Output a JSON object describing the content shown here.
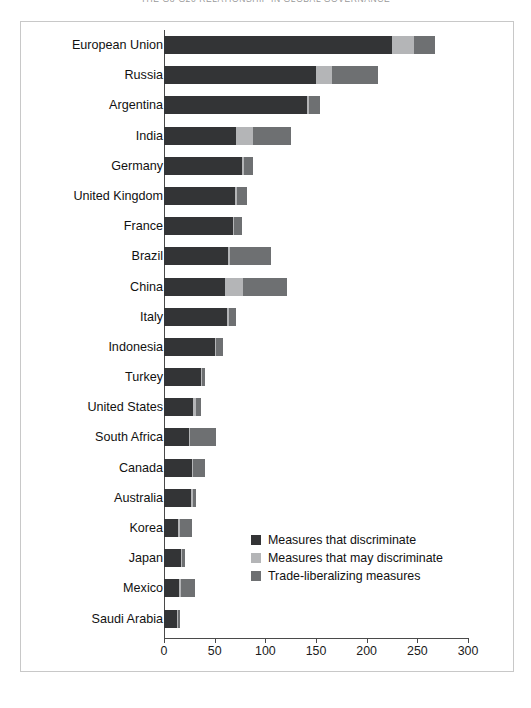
{
  "running_head": "THE G8-G20 RELATIONSHIP IN GLOBAL GOVERNANCE",
  "chart_data": {
    "type": "bar",
    "orientation": "horizontal",
    "stacked": true,
    "title": "",
    "xlabel": "",
    "ylabel": "",
    "xlim": [
      0,
      300
    ],
    "xticks": [
      0,
      50,
      100,
      150,
      200,
      250,
      300
    ],
    "xtick_labels": [
      "0",
      "50",
      "100",
      "150",
      "200",
      "250",
      "300"
    ],
    "grid": false,
    "legend_position": "center-right-inside",
    "colors": {
      "discriminate": "#333436",
      "may_discriminate": "#b4b5b7",
      "liberalizing": "#6e7072",
      "frame": "#c8c8c8",
      "axis": "#4a4a4a"
    },
    "categories": [
      "European Union",
      "Russia",
      "Argentina",
      "India",
      "Germany",
      "United Kingdom",
      "France",
      "Brazil",
      "China",
      "Italy",
      "Indonesia",
      "Turkey",
      "United States",
      "South Africa",
      "Canada",
      "Australia",
      "Korea",
      "Japan",
      "Mexico",
      "Saudi Arabia"
    ],
    "series": [
      {
        "name": "Measures that discriminate",
        "color": "#333436",
        "values": [
          225,
          150,
          141,
          71,
          77,
          70,
          68,
          63,
          60,
          62,
          50,
          37,
          29,
          25,
          28,
          27,
          14,
          17,
          15,
          13
        ]
      },
      {
        "name": "Measures that may discriminate",
        "color": "#b4b5b7",
        "values": [
          22,
          16,
          2,
          17,
          2,
          2,
          1,
          2,
          18,
          2,
          1,
          1,
          3,
          1,
          1,
          2,
          2,
          1,
          2,
          1
        ]
      },
      {
        "name": "Trade-liberalizing measures",
        "color": "#6e7072",
        "values": [
          20,
          45,
          11,
          37,
          9,
          10,
          8,
          41,
          43,
          7,
          7,
          2,
          5,
          25,
          11,
          3,
          12,
          3,
          14,
          2
        ]
      }
    ],
    "totals": [
      267,
      211,
      154,
      125,
      88,
      82,
      77,
      106,
      121,
      71,
      58,
      40,
      37,
      51,
      40,
      32,
      28,
      21,
      31,
      16
    ]
  },
  "legend": {
    "items": [
      {
        "label": "Measures that discriminate",
        "color": "#333436"
      },
      {
        "label": "Measures that may discriminate",
        "color": "#b4b5b7"
      },
      {
        "label": "Trade-liberalizing measures",
        "color": "#6e7072"
      }
    ]
  }
}
